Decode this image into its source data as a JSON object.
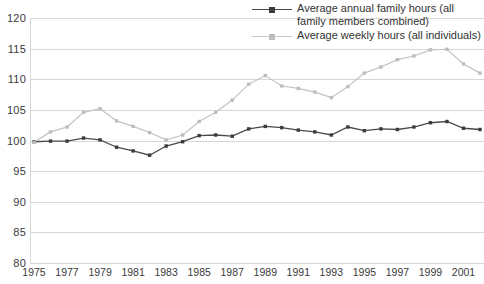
{
  "chart_data": {
    "type": "line",
    "title": "",
    "xlabel": "",
    "ylabel": "",
    "ylim": [
      80,
      120
    ],
    "ytick_values": [
      120,
      115,
      110,
      105,
      100,
      95,
      90,
      85,
      80
    ],
    "ytick_labels": [
      "120",
      "115",
      "110",
      "105",
      "100",
      "95",
      "90",
      "85",
      "80"
    ],
    "grid": true,
    "legend_position": "top-right",
    "x": [
      1975,
      1976,
      1977,
      1978,
      1979,
      1980,
      1981,
      1982,
      1983,
      1984,
      1985,
      1986,
      1987,
      1988,
      1989,
      1990,
      1991,
      1992,
      1993,
      1994,
      1995,
      1996,
      1997,
      1998,
      1999,
      2000,
      2001,
      2002
    ],
    "xtick_labels": [
      "1975",
      "1977",
      "1979",
      "1981",
      "1983",
      "1985",
      "1987",
      "1989",
      "1991",
      "1993",
      "1995",
      "1997",
      "1999",
      "2001"
    ],
    "xtick_values": [
      1975,
      1977,
      1979,
      1981,
      1983,
      1985,
      1987,
      1989,
      1991,
      1993,
      1995,
      1997,
      1999,
      2001
    ],
    "series": [
      {
        "name": "Average annual family hours (all family members combined)",
        "color": "#4a4a4a",
        "marker_color": "#3b3b3b",
        "values": [
          99.8,
          99.9,
          99.9,
          100.4,
          100.1,
          98.9,
          98.3,
          97.6,
          99.1,
          99.8,
          100.8,
          100.9,
          100.7,
          101.9,
          102.3,
          102.1,
          101.7,
          101.4,
          100.9,
          102.2,
          101.6,
          101.9,
          101.8,
          102.2,
          102.9,
          103.1,
          102.0,
          101.8
        ]
      },
      {
        "name": "Average weekly hours (all individuals)",
        "color": "#c2c2c2",
        "marker_color": "#bdbdbd",
        "values": [
          99.7,
          101.4,
          102.2,
          104.6,
          105.2,
          103.2,
          102.3,
          101.3,
          100.1,
          100.9,
          103.1,
          104.6,
          106.6,
          109.2,
          110.6,
          108.9,
          108.5,
          107.9,
          107.0,
          108.8,
          111.0,
          112.0,
          113.2,
          113.8,
          114.8,
          114.9,
          112.5,
          111.0
        ]
      }
    ]
  },
  "legend": {
    "items": [
      {
        "label": "Average annual family hours (all family members combined)",
        "swatch": "dark-line-marker"
      },
      {
        "label": "Average weekly hours (all individuals)",
        "swatch": "light-line-marker"
      }
    ]
  }
}
